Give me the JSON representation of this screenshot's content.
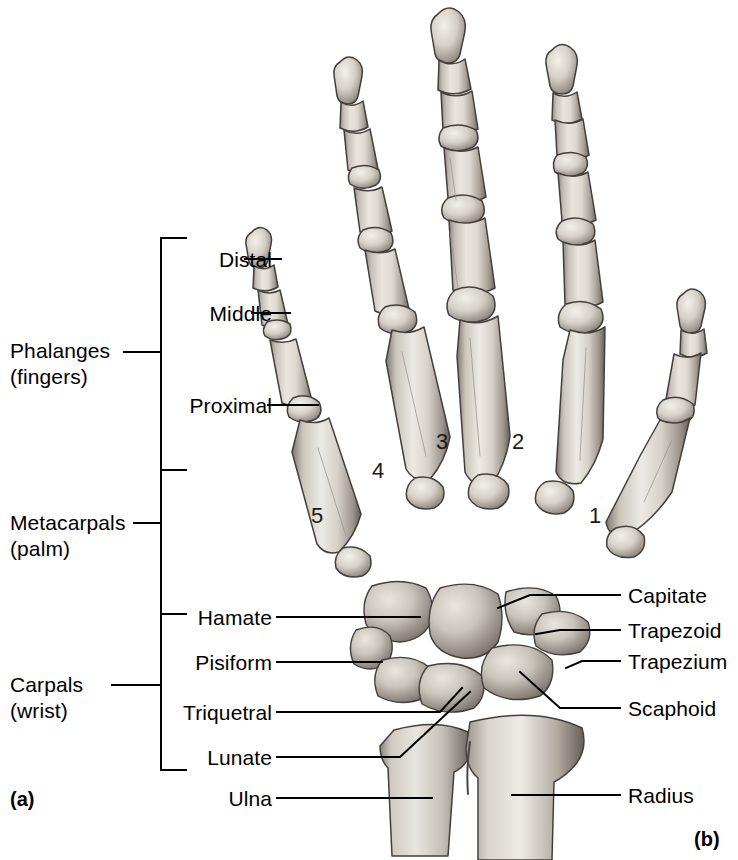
{
  "figure": {
    "panel_a_tag": "(a)",
    "panel_b_tag": "(b)",
    "view": "anterior (palmar) view of right hand skeleton"
  },
  "groups": [
    {
      "name": "phalanges",
      "line1": "Phalanges",
      "line2": "(fingers)"
    },
    {
      "name": "metacarpals",
      "line1": "Metacarpals",
      "line2": "(palm)"
    },
    {
      "name": "carpals",
      "line1": "Carpals",
      "line2": "(wrist)"
    }
  ],
  "left_labels": [
    {
      "name": "distal",
      "text": "Distal"
    },
    {
      "name": "middle",
      "text": "Middle"
    },
    {
      "name": "proximal",
      "text": "Proximal"
    },
    {
      "name": "hamate",
      "text": "Hamate"
    },
    {
      "name": "pisiform",
      "text": "Pisiform"
    },
    {
      "name": "triquetral",
      "text": "Triquetral"
    },
    {
      "name": "lunate",
      "text": "Lunate"
    },
    {
      "name": "ulna",
      "text": "Ulna"
    }
  ],
  "right_labels": [
    {
      "name": "capitate",
      "text": "Capitate"
    },
    {
      "name": "trapezoid",
      "text": "Trapezoid"
    },
    {
      "name": "trapezium",
      "text": "Trapezium"
    },
    {
      "name": "scaphoid",
      "text": "Scaphoid"
    },
    {
      "name": "radius",
      "text": "Radius"
    }
  ],
  "metacarpal_numbers": [
    {
      "name": "metacarpal-5",
      "text": "5"
    },
    {
      "name": "metacarpal-4",
      "text": "4"
    },
    {
      "name": "metacarpal-3",
      "text": "3"
    },
    {
      "name": "metacarpal-2",
      "text": "2"
    },
    {
      "name": "metacarpal-1",
      "text": "1"
    }
  ],
  "colors": {
    "background": "#ffffff",
    "ink": "#000000",
    "bone_light": "#e6e2da",
    "bone_mid": "#c9c4ba",
    "bone_shadow": "#8e8880",
    "bone_dark": "#5c5650",
    "outline": "#3a3632"
  }
}
